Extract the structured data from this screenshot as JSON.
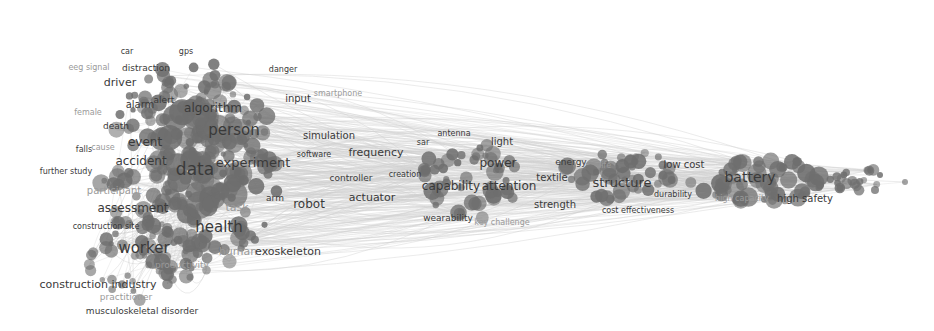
{
  "network": {
    "type": "keyword co-occurrence map",
    "node_color": "#6e6e6e",
    "edge_color": "#cfcfcf",
    "background": "#ffffff",
    "labels": [
      {
        "text": "car",
        "x": 127,
        "y": 52,
        "size": 8
      },
      {
        "text": "gps",
        "x": 186,
        "y": 52,
        "size": 8
      },
      {
        "text": "eeg signal",
        "x": 89,
        "y": 68,
        "size": 8,
        "faint": true
      },
      {
        "text": "distraction",
        "x": 146,
        "y": 68,
        "size": 9
      },
      {
        "text": "danger",
        "x": 283,
        "y": 70,
        "size": 8
      },
      {
        "text": "driver",
        "x": 120,
        "y": 82,
        "size": 11
      },
      {
        "text": "input",
        "x": 298,
        "y": 99,
        "size": 10
      },
      {
        "text": "smartphone",
        "x": 338,
        "y": 94,
        "size": 8,
        "faint": true
      },
      {
        "text": "alert",
        "x": 164,
        "y": 100,
        "size": 9
      },
      {
        "text": "alarm",
        "x": 140,
        "y": 105,
        "size": 10
      },
      {
        "text": "algorithm",
        "x": 213,
        "y": 108,
        "size": 12
      },
      {
        "text": "female",
        "x": 88,
        "y": 113,
        "size": 8,
        "faint": true
      },
      {
        "text": "death",
        "x": 116,
        "y": 126,
        "size": 9
      },
      {
        "text": "person",
        "x": 234,
        "y": 130,
        "size": 15
      },
      {
        "text": "simulation",
        "x": 329,
        "y": 136,
        "size": 10
      },
      {
        "text": "antenna",
        "x": 454,
        "y": 134,
        "size": 8
      },
      {
        "text": "falls",
        "x": 84,
        "y": 150,
        "size": 8
      },
      {
        "text": "cause",
        "x": 103,
        "y": 148,
        "size": 8,
        "faint": true
      },
      {
        "text": "event",
        "x": 145,
        "y": 142,
        "size": 12
      },
      {
        "text": "light",
        "x": 502,
        "y": 142,
        "size": 10
      },
      {
        "text": "software",
        "x": 314,
        "y": 155,
        "size": 8
      },
      {
        "text": "frequency",
        "x": 376,
        "y": 152,
        "size": 11
      },
      {
        "text": "sar",
        "x": 423,
        "y": 143,
        "size": 8
      },
      {
        "text": "accident",
        "x": 141,
        "y": 161,
        "size": 12
      },
      {
        "text": "experiment",
        "x": 253,
        "y": 162,
        "size": 13
      },
      {
        "text": "data",
        "x": 195,
        "y": 169,
        "size": 17
      },
      {
        "text": "power",
        "x": 498,
        "y": 163,
        "size": 12
      },
      {
        "text": "energy",
        "x": 571,
        "y": 162,
        "size": 9
      },
      {
        "text": "life",
        "x": 605,
        "y": 166,
        "size": 8,
        "faint": true
      },
      {
        "text": "low cost",
        "x": 684,
        "y": 165,
        "size": 10
      },
      {
        "text": "further study",
        "x": 66,
        "y": 172,
        "size": 8
      },
      {
        "text": "controller",
        "x": 351,
        "y": 178,
        "size": 9
      },
      {
        "text": "creation",
        "x": 405,
        "y": 175,
        "size": 8
      },
      {
        "text": "battery",
        "x": 750,
        "y": 177,
        "size": 14
      },
      {
        "text": "textile",
        "x": 552,
        "y": 178,
        "size": 10
      },
      {
        "text": "structure",
        "x": 622,
        "y": 182,
        "size": 13
      },
      {
        "text": "capability",
        "x": 451,
        "y": 186,
        "size": 12
      },
      {
        "text": "attention",
        "x": 509,
        "y": 186,
        "size": 12
      },
      {
        "text": "participant",
        "x": 114,
        "y": 191,
        "size": 10,
        "faint": true
      },
      {
        "text": "actuator",
        "x": 372,
        "y": 197,
        "size": 11
      },
      {
        "text": "durability",
        "x": 673,
        "y": 195,
        "size": 8
      },
      {
        "text": "arm",
        "x": 275,
        "y": 198,
        "size": 9
      },
      {
        "text": "high capacity",
        "x": 742,
        "y": 199,
        "size": 8,
        "faint": true
      },
      {
        "text": "high safety",
        "x": 805,
        "y": 199,
        "size": 10
      },
      {
        "text": "robot",
        "x": 309,
        "y": 204,
        "size": 12
      },
      {
        "text": "strength",
        "x": 555,
        "y": 205,
        "size": 10
      },
      {
        "text": "task",
        "x": 237,
        "y": 207,
        "size": 11,
        "faint": true
      },
      {
        "text": "assessment",
        "x": 133,
        "y": 208,
        "size": 12
      },
      {
        "text": "cost effectiveness",
        "x": 638,
        "y": 211,
        "size": 8
      },
      {
        "text": "wearability",
        "x": 448,
        "y": 218,
        "size": 9
      },
      {
        "text": "key challenge",
        "x": 502,
        "y": 223,
        "size": 8,
        "faint": true
      },
      {
        "text": "construction site",
        "x": 106,
        "y": 227,
        "size": 8
      },
      {
        "text": "health",
        "x": 219,
        "y": 227,
        "size": 15
      },
      {
        "text": "worker",
        "x": 144,
        "y": 248,
        "size": 15
      },
      {
        "text": "human",
        "x": 238,
        "y": 251,
        "size": 11,
        "faint": true
      },
      {
        "text": "exoskeleton",
        "x": 288,
        "y": 251,
        "size": 11
      },
      {
        "text": "productivity",
        "x": 182,
        "y": 265,
        "size": 9,
        "faint": true
      },
      {
        "text": "construction industry",
        "x": 98,
        "y": 284,
        "size": 11
      },
      {
        "text": "practitioner",
        "x": 126,
        "y": 297,
        "size": 9,
        "faint": true
      },
      {
        "text": "musculoskeletal disorder",
        "x": 142,
        "y": 311,
        "size": 9
      }
    ]
  }
}
